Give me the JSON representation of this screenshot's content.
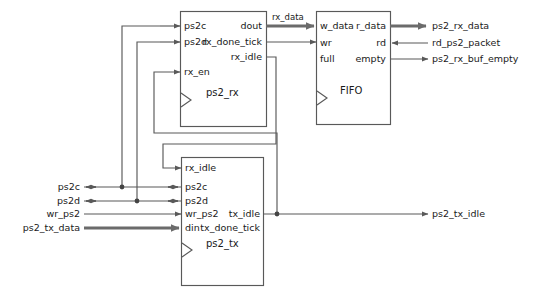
{
  "diagram": {
    "stroke_color": "#595959",
    "bus_color": "#6b6b6b",
    "text_color": "#1a1a1a",
    "background": "#ffffff"
  },
  "blocks": [
    {
      "id": "ps2_rx",
      "name": "ps2_rx",
      "x": 180,
      "y": 11,
      "w": 86,
      "h": 115,
      "inputs": [
        {
          "name": "ps2c",
          "y": 26
        },
        {
          "name": "ps2d",
          "y": 42
        },
        {
          "name": "rx_en",
          "y": 72
        }
      ],
      "outputs": [
        {
          "name": "dout",
          "y": 26
        },
        {
          "name": "rx_done_tick",
          "y": 42
        },
        {
          "name": "rx_idle",
          "y": 57
        }
      ],
      "has_clock": true
    },
    {
      "id": "fifo",
      "name": "FIFO",
      "x": 316,
      "y": 11,
      "w": 74,
      "h": 113,
      "inputs": [
        {
          "name": "w_data",
          "y": 26
        },
        {
          "name": "wr",
          "y": 43
        },
        {
          "name": "full",
          "y": 59
        }
      ],
      "outputs": [
        {
          "name": "r_data",
          "y": 26
        },
        {
          "name": "rd",
          "y": 43
        },
        {
          "name": "empty",
          "y": 59
        }
      ],
      "has_clock": true
    },
    {
      "id": "ps2_tx",
      "name": "ps2_tx",
      "x": 181,
      "y": 157,
      "w": 82,
      "h": 128,
      "inputs": [
        {
          "name": "rx_idle",
          "y": 168
        },
        {
          "name": "ps2c",
          "y": 187
        },
        {
          "name": "ps2d",
          "y": 201
        },
        {
          "name": "wr_ps2",
          "y": 214
        },
        {
          "name": "din",
          "y": 228
        }
      ],
      "outputs": [
        {
          "name": "tx_idle",
          "y": 214
        },
        {
          "name": "tx_done_tick",
          "y": 228
        }
      ],
      "has_clock": true
    }
  ],
  "external_left": [
    {
      "label": "ps2c",
      "y": 187,
      "bidirectional": true,
      "bus": false
    },
    {
      "label": "ps2d",
      "y": 201,
      "bidirectional": true,
      "bus": false
    },
    {
      "label": "wr_ps2",
      "y": 214,
      "bidirectional": false,
      "bus": false
    },
    {
      "label": "ps2_tx_data",
      "y": 228,
      "bidirectional": false,
      "bus": true
    }
  ],
  "external_right": [
    {
      "label": "ps2_rx_data",
      "y": 26,
      "direction": "out",
      "bus": true
    },
    {
      "label": "rd_ps2_packet",
      "y": 43,
      "direction": "in",
      "bus": false
    },
    {
      "label": "ps2_rx_buf_empty",
      "y": 59,
      "direction": "out",
      "bus": false
    },
    {
      "label": "ps2_tx_idle",
      "y": 214,
      "direction": "out",
      "bus": false
    }
  ],
  "wire_labels": [
    {
      "label": "rx_data",
      "x": 272,
      "y": 18
    }
  ]
}
